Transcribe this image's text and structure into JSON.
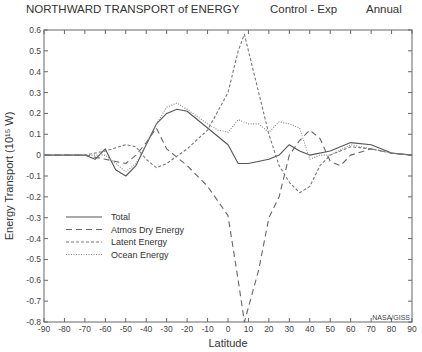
{
  "header": {
    "title": "NORTHWARD TRANSPORT of ENERGY",
    "experiment": "Control - Exp",
    "period": "Annual"
  },
  "credit": "NASA/GISS",
  "chart_data": {
    "type": "line",
    "title": "NORTHWARD TRANSPORT of ENERGY",
    "subtitle": "Control - Exp    Annual",
    "xlabel": "Latitude",
    "ylabel": "Energy Transport (10¹⁵ W)",
    "xlim": [
      -90,
      90
    ],
    "ylim": [
      -0.8,
      0.6
    ],
    "xticks": [
      -90,
      -80,
      -70,
      -60,
      -50,
      -40,
      -30,
      -20,
      -10,
      0,
      10,
      20,
      30,
      40,
      50,
      60,
      70,
      80,
      90
    ],
    "yticks": [
      0.6,
      0.5,
      0.4,
      0.3,
      0.2,
      0.1,
      0,
      -0.1,
      -0.2,
      -0.3,
      -0.4,
      -0.5,
      -0.6,
      -0.7,
      -0.8
    ],
    "ytick_labels": [
      "0.6",
      "0.5",
      "0.4",
      "0.3",
      "0.2",
      "0.1",
      "0",
      "-0.1",
      "-0.2",
      "-0.3",
      "-0.4",
      "-0.5",
      "-0.6",
      "-0.7",
      "-0.8"
    ],
    "grid": false,
    "legend_position": "lower left",
    "series": [
      {
        "name": "Total",
        "style": "solid",
        "x": [
          -90,
          -80,
          -70,
          -65,
          -60,
          -55,
          -50,
          -45,
          -40,
          -35,
          -30,
          -25,
          -20,
          -10,
          0,
          5,
          10,
          20,
          25,
          30,
          35,
          40,
          50,
          60,
          70,
          80,
          90
        ],
        "values": [
          0,
          0,
          0,
          -0.02,
          0.03,
          -0.07,
          -0.1,
          -0.05,
          0.05,
          0.15,
          0.2,
          0.22,
          0.21,
          0.13,
          0.05,
          -0.04,
          -0.04,
          -0.02,
          0.0,
          0.05,
          0.02,
          0.0,
          0.02,
          0.06,
          0.05,
          0.01,
          0
        ]
      },
      {
        "name": "Atmos Dry Energy",
        "style": "dashed",
        "x": [
          -90,
          -70,
          -60,
          -50,
          -45,
          -40,
          -35,
          -30,
          -20,
          -10,
          0,
          5,
          8,
          15,
          20,
          25,
          30,
          35,
          40,
          45,
          50,
          55,
          60,
          70,
          80,
          90
        ],
        "values": [
          0,
          0,
          -0.02,
          -0.04,
          0.0,
          0.06,
          0.13,
          0.03,
          -0.05,
          -0.15,
          -0.29,
          -0.6,
          -0.8,
          -0.55,
          -0.3,
          -0.2,
          0.0,
          0.07,
          0.12,
          0.08,
          -0.03,
          -0.05,
          0.0,
          0.03,
          0.01,
          0
        ]
      },
      {
        "name": "Latent Energy",
        "style": "short-dashed",
        "x": [
          -90,
          -70,
          -60,
          -50,
          -45,
          -40,
          -35,
          -30,
          -20,
          -10,
          0,
          5,
          8,
          15,
          20,
          25,
          30,
          35,
          40,
          45,
          50,
          60,
          70,
          80,
          90
        ],
        "values": [
          0,
          0,
          0.02,
          0.05,
          0.04,
          -0.02,
          -0.06,
          -0.04,
          0.03,
          0.12,
          0.3,
          0.5,
          0.58,
          0.3,
          0.1,
          -0.05,
          -0.13,
          -0.18,
          -0.15,
          -0.05,
          0.0,
          0.04,
          0.03,
          0.01,
          0
        ]
      },
      {
        "name": "Ocean Energy",
        "style": "dotted",
        "x": [
          -90,
          -60,
          -50,
          -45,
          -40,
          -35,
          -30,
          -25,
          -20,
          -10,
          -5,
          0,
          5,
          10,
          15,
          20,
          25,
          30,
          35,
          40,
          45,
          50,
          60,
          70,
          80,
          90
        ],
        "values": [
          0,
          0,
          -0.08,
          -0.04,
          0.05,
          0.15,
          0.23,
          0.25,
          0.22,
          0.15,
          0.12,
          0.11,
          0.17,
          0.15,
          0.15,
          0.11,
          0.16,
          0.15,
          0.13,
          -0.02,
          0.0,
          0.0,
          0.05,
          0.03,
          0.01,
          0
        ]
      }
    ]
  }
}
